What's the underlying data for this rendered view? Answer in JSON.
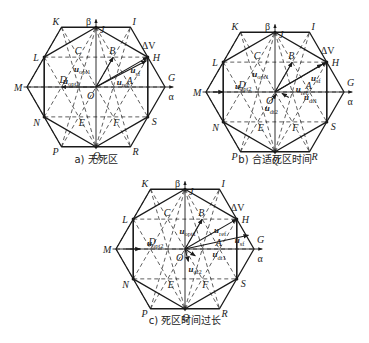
{
  "figure": {
    "panels": [
      {
        "id": "a",
        "caption": "a) 无死区",
        "center": [
          96,
          87
        ],
        "r": 69,
        "caption_pos": [
          96,
          163
        ],
        "vectors": [
          {
            "name": "u_ref",
            "from": [
              0,
              0
            ],
            "to": [
              0.75,
              -0.433
            ],
            "label": "u",
            "sub": "ref",
            "lpos": [
              0.3,
              -0.03
            ]
          },
          {
            "name": "u_opt1",
            "from": [
              0,
              0
            ],
            "to": [
              0.25,
              -0.433
            ],
            "label": "u",
            "sub": "opt1",
            "lpos": [
              -0.32,
              -0.22
            ]
          },
          {
            "name": "u_opt2",
            "from": [
              0,
              0
            ],
            "to": [
              -0.5,
              0
            ],
            "label": "u",
            "sub": "opt2",
            "lpos": [
              -0.48,
              -0.05
            ]
          },
          {
            "name": "u_sf",
            "from": [
              0,
              0
            ],
            "to": [
              0.73,
              -0.38
            ],
            "label": "u",
            "sub": "sf",
            "lpos": [
              0.5,
              -0.2
            ]
          }
        ]
      },
      {
        "id": "b",
        "caption": "b) 合适死区时间",
        "center": [
          275,
          92
        ],
        "r": 69,
        "caption_pos": [
          275,
          163
        ],
        "vectors": [
          {
            "name": "u_ref",
            "from": [
              0,
              0
            ],
            "to": [
              0.75,
              -0.433
            ],
            "label": "u",
            "sub": "ref",
            "lpos": [
              0.3,
              0.0
            ]
          },
          {
            "name": "u_opt1",
            "from": [
              0,
              0
            ],
            "to": [
              0.25,
              -0.433
            ],
            "label": "u",
            "sub": "opt1",
            "lpos": [
              -0.33,
              -0.22
            ]
          },
          {
            "name": "u_opt2",
            "from": [
              -0.9,
              0
            ],
            "to": [
              -0.75,
              0
            ],
            "label": "u",
            "sub": "opt2",
            "lpos": [
              -0.58,
              -0.05
            ]
          },
          {
            "name": "u_sf",
            "from": [
              0,
              0
            ],
            "to": [
              0.68,
              -0.4
            ],
            "label": "u",
            "sub": "sf",
            "lpos": [
              0.52,
              -0.16
            ]
          },
          {
            "name": "u_dt1",
            "from": [
              0.2,
              0.08
            ],
            "to": [
              0.1,
              0.02
            ],
            "label": "u",
            "sub": "dt1",
            "lpos": [
              0.42,
              0.12
            ]
          },
          {
            "name": "u_dt2",
            "from": [
              -0.05,
              0.12
            ],
            "to": [
              0.02,
              0.03
            ],
            "label": "u",
            "sub": "dt2",
            "lpos": [
              -0.15,
              0.28
            ]
          }
        ]
      },
      {
        "id": "c",
        "caption": "c) 死区时间过长",
        "center": [
          185,
          249
        ],
        "r": 69,
        "caption_pos": [
          185,
          324
        ],
        "vectors": [
          {
            "name": "u_ref",
            "from": [
              0,
              0
            ],
            "to": [
              0.75,
              -0.433
            ],
            "label": "u",
            "sub": "ref",
            "lpos": [
              0.42,
              -0.23
            ]
          },
          {
            "name": "u_opt1",
            "from": [
              0,
              0
            ],
            "to": [
              0.25,
              -0.433
            ],
            "label": "u",
            "sub": "opt1",
            "lpos": [
              -0.08,
              -0.22
            ]
          },
          {
            "name": "u_opt2",
            "from": [
              -0.85,
              0
            ],
            "to": [
              -0.65,
              0
            ],
            "label": "u",
            "sub": "opt2",
            "lpos": [
              -0.55,
              -0.05
            ]
          },
          {
            "name": "u_sf",
            "from": [
              0,
              0
            ],
            "to": [
              0.92,
              -0.2
            ],
            "label": "u",
            "sub": "sf",
            "lpos": [
              0.72,
              -0.08
            ]
          },
          {
            "name": "u_dt1",
            "from": [
              0.0,
              0.0
            ],
            "to": [
              0.15,
              0.1
            ],
            "label": "u",
            "sub": "dt1",
            "lpos": [
              0.4,
              0.12
            ]
          },
          {
            "name": "u_dt2",
            "from": [
              0.0,
              0.0
            ],
            "to": [
              0.05,
              0.18
            ],
            "label": "u",
            "sub": "dt2",
            "lpos": [
              0.05,
              0.33
            ]
          }
        ]
      }
    ],
    "points": [
      {
        "name": "O",
        "x": 0,
        "y": 0,
        "dx": -9,
        "dy": 12
      },
      {
        "name": "A",
        "x": 0.5,
        "y": 0,
        "dx": -4,
        "dy": -3
      },
      {
        "name": "B",
        "x": 0.25,
        "y": -0.433,
        "dx": -4,
        "dy": -3
      },
      {
        "name": "C",
        "x": -0.25,
        "y": -0.433,
        "dx": -4,
        "dy": -3
      },
      {
        "name": "D",
        "x": -0.5,
        "y": 0,
        "dx": -2,
        "dy": -4
      },
      {
        "name": "E",
        "x": -0.25,
        "y": 0.433,
        "dx": 0,
        "dy": 9
      },
      {
        "name": "F",
        "x": 0.25,
        "y": 0.433,
        "dx": 0,
        "dy": 9
      },
      {
        "name": "G",
        "x": 1.0,
        "y": 0,
        "dx": 3,
        "dy": -6
      },
      {
        "name": "H",
        "x": 0.75,
        "y": -0.433,
        "dx": 5,
        "dy": 4
      },
      {
        "name": "I",
        "x": 0.5,
        "y": -0.866,
        "dx": 2,
        "dy": -2
      },
      {
        "name": "J",
        "x": 0,
        "y": -0.866,
        "dx": 4,
        "dy": 6
      },
      {
        "name": "K",
        "x": -0.5,
        "y": -0.866,
        "dx": -9,
        "dy": -2
      },
      {
        "name": "L",
        "x": -0.75,
        "y": -0.433,
        "dx": -11,
        "dy": 4
      },
      {
        "name": "M",
        "x": -1.0,
        "y": 0,
        "dx": -13,
        "dy": 4
      },
      {
        "name": "N",
        "x": -0.75,
        "y": 0.433,
        "dx": -11,
        "dy": 9
      },
      {
        "name": "P",
        "x": -0.5,
        "y": 0.866,
        "dx": -9,
        "dy": 8
      },
      {
        "name": "Q",
        "x": 0,
        "y": 0.866,
        "dx": -3,
        "dy": 12
      },
      {
        "name": "R",
        "x": 0.5,
        "y": 0.866,
        "dx": 2,
        "dy": 8
      },
      {
        "name": "S",
        "x": 0.75,
        "y": 0.433,
        "dx": 4,
        "dy": 8
      }
    ],
    "axis_labels": {
      "alpha": "α",
      "beta": "β",
      "delta_v": "ΔV"
    }
  }
}
